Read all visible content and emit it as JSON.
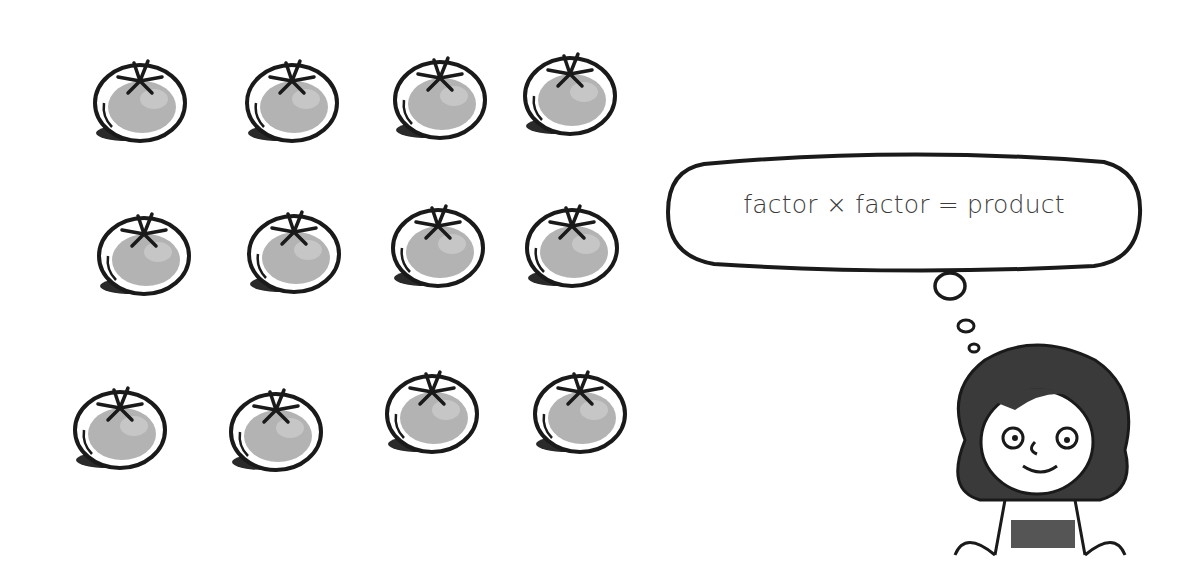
{
  "illustration": {
    "title": "Tomato array with thought bubble",
    "thought_bubble": {
      "text": "factor × factor = product"
    },
    "array": {
      "rows": 3,
      "columns": 4,
      "item": "tomato",
      "total": 12
    },
    "character": "curly-haired-child-thinking"
  },
  "tomatoes": [
    {
      "x": 88,
      "y": 55
    },
    {
      "x": 240,
      "y": 55
    },
    {
      "x": 388,
      "y": 52
    },
    {
      "x": 518,
      "y": 48
    },
    {
      "x": 92,
      "y": 208
    },
    {
      "x": 242,
      "y": 206
    },
    {
      "x": 386,
      "y": 200
    },
    {
      "x": 520,
      "y": 200
    },
    {
      "x": 68,
      "y": 382
    },
    {
      "x": 224,
      "y": 384
    },
    {
      "x": 380,
      "y": 366
    },
    {
      "x": 528,
      "y": 366
    }
  ]
}
